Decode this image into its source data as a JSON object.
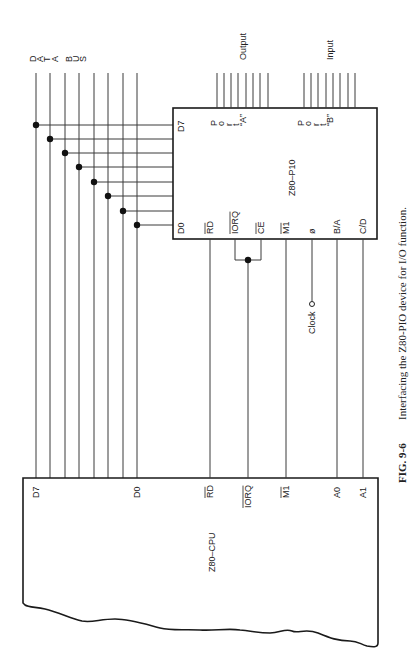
{
  "figure": {
    "caption_number": "FIG. 9-6",
    "caption_text": "Interfacing the Z80-PIO device for I/O function."
  },
  "data_bus": {
    "label_letters": [
      "D",
      "A",
      "T",
      "A",
      "",
      "B",
      "U",
      "S"
    ],
    "lines_x": [
      36,
      50,
      65,
      79,
      94,
      108,
      123,
      137
    ],
    "taps_y": [
      125,
      139,
      153,
      167,
      182,
      196,
      211,
      225
    ]
  },
  "pio": {
    "name": "Z80–P10",
    "box": {
      "x": 173,
      "y": 108,
      "w": 204,
      "h": 131
    },
    "data_pins": {
      "top": "D7",
      "bottom": "D0"
    },
    "control_pins": [
      {
        "label": "RD",
        "overline": true,
        "x": 210
      },
      {
        "label": "IORQ",
        "overline": true,
        "x": 235
      },
      {
        "label": "CE",
        "overline": true,
        "x": 261
      },
      {
        "label": "M1",
        "overline": true,
        "x": 286
      },
      {
        "label": "ø",
        "overline": false,
        "x": 312
      },
      {
        "label": "B/A",
        "overline": false,
        "x": 337
      },
      {
        "label": "C/D",
        "overline": false,
        "x": 363
      }
    ],
    "port_a": {
      "letters": [
        "P",
        "o",
        "r",
        "t",
        "“A”"
      ],
      "direction_label": "Output",
      "lines_x": [
        217,
        224,
        231,
        238,
        246,
        253,
        260,
        268
      ]
    },
    "port_b": {
      "letters": [
        "P",
        "o",
        "r",
        "t",
        "“B”"
      ],
      "direction_label": "Input",
      "lines_x": [
        304,
        311,
        318,
        326,
        333,
        340,
        348,
        355
      ]
    }
  },
  "cpu": {
    "name": "Z80–CPU",
    "box": {
      "x": 23,
      "y": 478,
      "w": 355
    },
    "pins": [
      {
        "label": "D7",
        "overline": false,
        "x": 36
      },
      {
        "label": "D0",
        "overline": false,
        "x": 137
      },
      {
        "label": "RD",
        "overline": true,
        "x": 210
      },
      {
        "label": "IORQ",
        "overline": true,
        "x": 248
      },
      {
        "label": "M1",
        "overline": true,
        "x": 286
      },
      {
        "label": "A0",
        "overline": false,
        "x": 337
      },
      {
        "label": "A1",
        "overline": false,
        "x": 363
      }
    ]
  },
  "clock": {
    "label": "Clock",
    "x": 312,
    "y": 304
  },
  "colors": {
    "ink": "#1a1a1a",
    "paper": "#ffffff"
  }
}
